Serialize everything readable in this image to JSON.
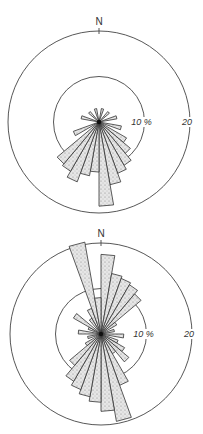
{
  "chart_data": [
    {
      "type": "rose",
      "title": "",
      "north_label": "N",
      "ring_labels": [
        "10 %",
        "20"
      ],
      "rings_percent": [
        10,
        20
      ],
      "sector_width_deg": 10,
      "center": [
        99,
        122
      ],
      "px_per_percent": 4.55,
      "petals": [
        {
          "dir": 15,
          "value": 3
        },
        {
          "dir": 45,
          "value": 3
        },
        {
          "dir": 75,
          "value": 4
        },
        {
          "dir": 105,
          "value": 5
        },
        {
          "dir": 125,
          "value": 7
        },
        {
          "dir": 135,
          "value": 9
        },
        {
          "dir": 145,
          "value": 11
        },
        {
          "dir": 155,
          "value": 12
        },
        {
          "dir": 165,
          "value": 14
        },
        {
          "dir": 175,
          "value": 18.5
        },
        {
          "dir": 185,
          "value": 11
        },
        {
          "dir": 195,
          "value": 12
        },
        {
          "dir": 205,
          "value": 14
        },
        {
          "dir": 215,
          "value": 12.5
        },
        {
          "dir": 225,
          "value": 12
        },
        {
          "dir": 245,
          "value": 6
        },
        {
          "dir": 285,
          "value": 4
        },
        {
          "dir": 315,
          "value": 3
        },
        {
          "dir": 345,
          "value": 3
        }
      ]
    },
    {
      "type": "rose",
      "title": "",
      "north_label": "N",
      "ring_labels": [
        "10 %",
        "20"
      ],
      "rings_percent": [
        10,
        20
      ],
      "sector_width_deg": 10,
      "center": [
        101,
        117
      ],
      "px_per_percent": 4.55,
      "petals": [
        {
          "dir": 5,
          "value": 17.5
        },
        {
          "dir": 15,
          "value": 13.5
        },
        {
          "dir": 25,
          "value": 13
        },
        {
          "dir": 35,
          "value": 12.5
        },
        {
          "dir": 45,
          "value": 11.5
        },
        {
          "dir": 55,
          "value": 4
        },
        {
          "dir": 75,
          "value": 3
        },
        {
          "dir": 95,
          "value": 5
        },
        {
          "dir": 115,
          "value": 4
        },
        {
          "dir": 125,
          "value": 6
        },
        {
          "dir": 135,
          "value": 8
        },
        {
          "dir": 145,
          "value": 5
        },
        {
          "dir": 155,
          "value": 12
        },
        {
          "dir": 165,
          "value": 19.5
        },
        {
          "dir": 175,
          "value": 17
        },
        {
          "dir": 185,
          "value": 15
        },
        {
          "dir": 195,
          "value": 14
        },
        {
          "dir": 205,
          "value": 13
        },
        {
          "dir": 215,
          "value": 12
        },
        {
          "dir": 225,
          "value": 9
        },
        {
          "dir": 235,
          "value": 4
        },
        {
          "dir": 255,
          "value": 3
        },
        {
          "dir": 275,
          "value": 5
        },
        {
          "dir": 295,
          "value": 3
        },
        {
          "dir": 305,
          "value": 7
        },
        {
          "dir": 325,
          "value": 4
        },
        {
          "dir": 335,
          "value": 6
        },
        {
          "dir": 345,
          "value": 20.5
        },
        {
          "dir": 355,
          "value": 8
        }
      ]
    }
  ]
}
